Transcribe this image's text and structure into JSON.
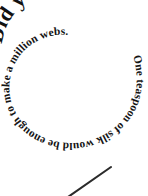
{
  "image": {
    "width": 148,
    "height": 196,
    "background_color": "#ffffff",
    "ink_color": "#111111"
  },
  "spiral_text": {
    "headline": "Did you know?",
    "fact": "One teaspoon of silk would be enough to make a million webs.",
    "full_text": "Did you know? One teaspoon of silk would be enough to make a million webs.",
    "direction": "clockwise-inward",
    "style": "bold-serif"
  },
  "mark": {
    "label": "diagonal-stroke",
    "color": "#2b2b2b",
    "start_x": 68,
    "start_y": 197,
    "end_x": 111,
    "end_y": 167
  }
}
